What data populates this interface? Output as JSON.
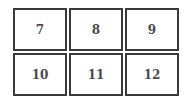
{
  "cells": [
    {
      "label": "7"
    },
    {
      "label": "8"
    },
    {
      "label": "9"
    },
    {
      "label": "10"
    },
    {
      "label": "11"
    },
    {
      "label": "12"
    }
  ]
}
